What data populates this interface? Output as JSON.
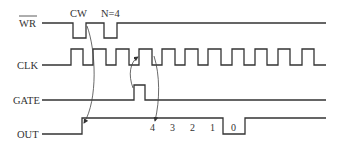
{
  "diagram": {
    "type": "timing-diagram",
    "signals": [
      {
        "name": "WR",
        "overline": true
      },
      {
        "name": "CLK",
        "overline": false
      },
      {
        "name": "GATE",
        "overline": false
      },
      {
        "name": "OUT",
        "overline": false
      }
    ],
    "annotations": {
      "cw": "CW",
      "n": "N=4"
    },
    "count_labels": [
      "4",
      "3",
      "2",
      "1",
      "0"
    ],
    "colors": {
      "line": "#333333",
      "background": "#ffffff"
    }
  }
}
